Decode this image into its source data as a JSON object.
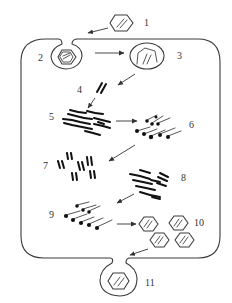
{
  "diagram": {
    "type": "virus-replication-cycle",
    "colors": {
      "line": "#3a3a3a",
      "fill_dark": "#111111",
      "background": "#ffffff",
      "label": "#333333"
    },
    "stages": [
      {
        "id": 1,
        "label": "1",
        "depiction": "free hexagonal virion with nucleic acid outside cell"
      },
      {
        "id": 2,
        "label": "2",
        "depiction": "virion enclosed in endocytic vesicle pinching from membrane"
      },
      {
        "id": 3,
        "label": "3",
        "depiction": "vesicle with uncoating capsid"
      },
      {
        "id": 4,
        "label": "4",
        "depiction": "released nucleic acid strands"
      },
      {
        "id": 5,
        "label": "5",
        "depiction": "replicating nucleic acid strands"
      },
      {
        "id": 6,
        "label": "6",
        "depiction": "strands with attached dots (translation)"
      },
      {
        "id": 7,
        "label": "7",
        "depiction": "multiple double-strand nucleic acid copies"
      },
      {
        "id": 8,
        "label": "8",
        "depiction": "cluster of strands (protein synthesis)"
      },
      {
        "id": 9,
        "label": "9",
        "depiction": "strands with attached dots (assembly)"
      },
      {
        "id": 10,
        "label": "10",
        "depiction": "four assembled hexagonal virions"
      },
      {
        "id": 11,
        "label": "11",
        "depiction": "virion in vesicle budding out of cell (release)"
      }
    ],
    "arrows": [
      {
        "from": 1,
        "to": 2
      },
      {
        "from": 2,
        "to": 3
      },
      {
        "from": 3,
        "to": 4
      },
      {
        "from": 4,
        "to": 5
      },
      {
        "from": 5,
        "to": 6
      },
      {
        "from": 6,
        "to": 7
      },
      {
        "from": 8,
        "to": 9
      },
      {
        "from": 9,
        "to": 10
      },
      {
        "from": 10,
        "to": 11
      }
    ]
  }
}
